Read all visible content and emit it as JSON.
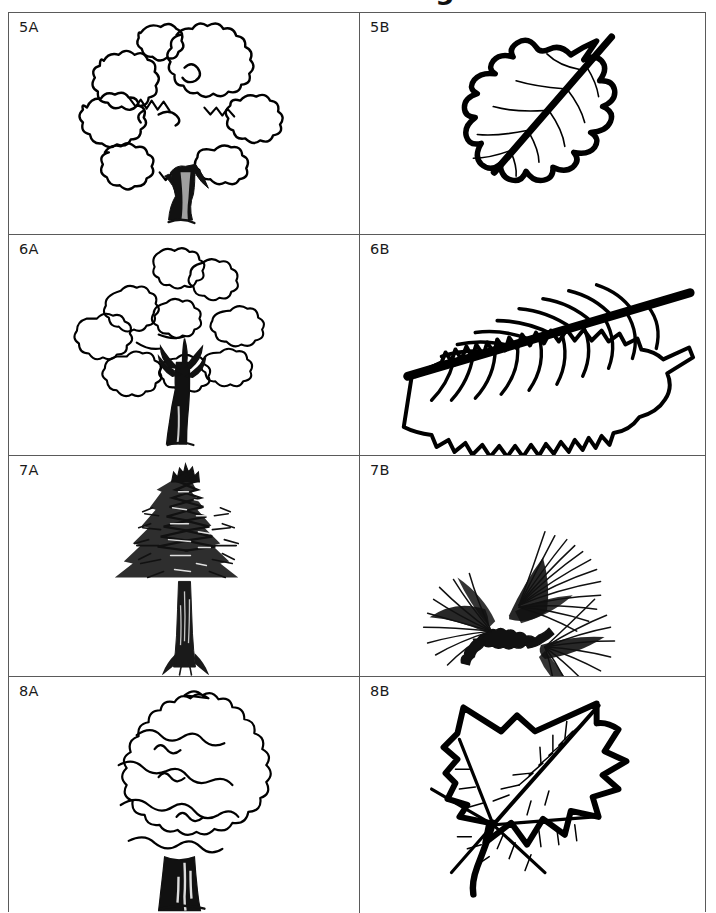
{
  "page": {
    "title": "Tree-Leaf Matching Game",
    "background_color": "#ffffff",
    "ink_color": "#000000",
    "grid_line_color": "#5a5a5a"
  },
  "grid": {
    "columns": 2,
    "rows": 4,
    "column_headers": [
      "Tree",
      "Leaf"
    ],
    "cells": [
      {
        "label": "5A",
        "column": "A",
        "row": 1,
        "artwork": "broadleaf-tree-bushy-crown",
        "description": "Line drawing of a round-crowned deciduous tree with a short forked dark trunk"
      },
      {
        "label": "5B",
        "column": "B",
        "row": 1,
        "artwork": "oak-leaf",
        "description": "Line drawing of a rounded-lobed oak leaf with a long diagonal midrib"
      },
      {
        "label": "6A",
        "column": "A",
        "row": 2,
        "artwork": "broadleaf-tree-scalloped-crown",
        "description": "Line drawing of a deciduous tree with a scalloped cloud-like crown and branching dark trunk"
      },
      {
        "label": "6B",
        "column": "B",
        "row": 2,
        "artwork": "elm-leaf-serrated",
        "description": "Line drawing of an elongated serrated leaf with strong parallel side veins and a thick midrib"
      },
      {
        "label": "7A",
        "column": "A",
        "row": 3,
        "artwork": "conifer-pine-tree",
        "description": "Line drawing of a tall narrow conifer with a long bare trunk and conical needled crown"
      },
      {
        "label": "7B",
        "column": "B",
        "row": 3,
        "artwork": "pine-needle-cluster",
        "description": "Line drawing of a pine twig bearing two fascicles of long thin needles"
      },
      {
        "label": "8A",
        "column": "A",
        "row": 4,
        "artwork": "broadleaf-tree-round-crown",
        "description": "Line drawing of a broad round-crowned tree with a thick solid black trunk"
      },
      {
        "label": "8B",
        "column": "B",
        "row": 4,
        "artwork": "maple-leaf-pointed-lobes",
        "description": "Line drawing of a pointed-lobed maple/sycamore leaf with a long stem and branching veins"
      }
    ]
  }
}
